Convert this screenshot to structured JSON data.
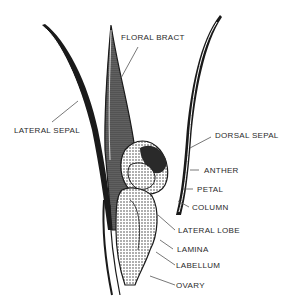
{
  "diagram": {
    "labels": {
      "floral_bract": "FLORAL BRACT",
      "lateral_sepal": "LATERAL SEPAL",
      "dorsal_sepal": "DORSAL SEPAL",
      "anther": "ANTHER",
      "petal": "PETAL",
      "column": "COLUMN",
      "lateral_lobe": "LATERAL LOBE",
      "lamina": "LAMINA",
      "labellum": "LABELLUM",
      "ovary": "OVARY"
    },
    "colors": {
      "ink": "#1a1a1a",
      "background": "#ffffff",
      "leader_line": "#555555"
    }
  }
}
